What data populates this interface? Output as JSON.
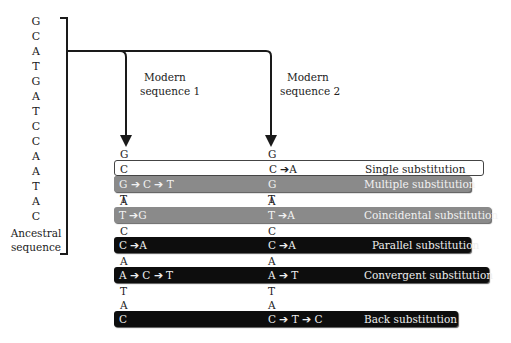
{
  "ancestral": {
    "bases": [
      "G",
      "C",
      "A",
      "T",
      "G",
      "A",
      "T",
      "C",
      "C",
      "A",
      "A",
      "T",
      "A",
      "C"
    ],
    "label_line1": "Ancestral",
    "label_line2": "sequence"
  },
  "modern1": {
    "label_line1": "Modern",
    "label_line2": "sequence 1"
  },
  "modern2": {
    "label_line1": "Modern",
    "label_line2": "sequence 2"
  },
  "rows": [
    {
      "type": "base",
      "seq1": "G",
      "seq2": "G"
    },
    {
      "type": "bar",
      "style": "white",
      "seq1": "C",
      "seq2": "C ➔A",
      "label": "Single substitution"
    },
    {
      "type": "base",
      "seq1": "A",
      "seq2": "A"
    },
    {
      "type": "base",
      "seq1": "T",
      "seq2": "T"
    },
    {
      "type": "bar",
      "style": "grey",
      "seq1": "G ➔ C ➔ T",
      "seq2": "G",
      "label": "Multiple substitution"
    },
    {
      "type": "base",
      "seq1": "A",
      "seq2": "A"
    },
    {
      "type": "bar",
      "style": "grey",
      "seq1": "T ➔G",
      "seq2": "T ➔A",
      "label": "Coincidental substitution"
    },
    {
      "type": "base",
      "seq1": "C",
      "seq2": "C"
    },
    {
      "type": "bar",
      "style": "black",
      "seq1": " C ➔A",
      "seq2": "C ➔A",
      "label": "Parallel substitution"
    },
    {
      "type": "base",
      "seq1": "A",
      "seq2": "A"
    },
    {
      "type": "bar",
      "style": "black",
      "seq1": "A ➔ C ➔ T",
      "seq2": "A ➔ T",
      "label": "Convergent substitution"
    },
    {
      "type": "base",
      "seq1": "T",
      "seq2": "T"
    },
    {
      "type": "base",
      "seq1": "A",
      "seq2": "A"
    },
    {
      "type": "bar",
      "style": "black",
      "seq1": "C",
      "seq2": "C ➔ T ➔ C",
      "label": "Back substitution"
    }
  ],
  "colors": {
    "white_bar": "#ffffff",
    "grey_bar": "#8a8a8a",
    "black_bar": "#0d0d0d",
    "line": "#1a1a1a"
  }
}
